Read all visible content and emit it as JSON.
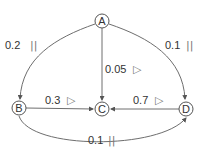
{
  "diagram": {
    "type": "directed-graph",
    "nodes": [
      {
        "id": "A",
        "label": "A",
        "x": 102,
        "y": 21
      },
      {
        "id": "B",
        "label": "B",
        "x": 19,
        "y": 108
      },
      {
        "id": "C",
        "label": "C",
        "x": 102,
        "y": 109
      },
      {
        "id": "D",
        "label": "D",
        "x": 186,
        "y": 109
      }
    ],
    "edges": [
      {
        "from": "A",
        "to": "B",
        "weight": "0.2",
        "marker": "||",
        "marker_name": "pause"
      },
      {
        "from": "A",
        "to": "D",
        "weight": "0.1",
        "marker": "||",
        "marker_name": "pause"
      },
      {
        "from": "A",
        "to": "C",
        "weight": "0.05",
        "marker": "▷",
        "marker_name": "play"
      },
      {
        "from": "B",
        "to": "C",
        "weight": "0.3",
        "marker": "▷",
        "marker_name": "play"
      },
      {
        "from": "D",
        "to": "C",
        "weight": "0.7",
        "marker": "▷",
        "marker_name": "play"
      },
      {
        "from": "B",
        "to": "D",
        "weight": "0.1",
        "marker": "||",
        "marker_name": "pause"
      }
    ]
  },
  "colors": {
    "edge": "#6e6e6e",
    "node_stroke": "#555555",
    "text": "#333333",
    "background": "#ffffff"
  }
}
